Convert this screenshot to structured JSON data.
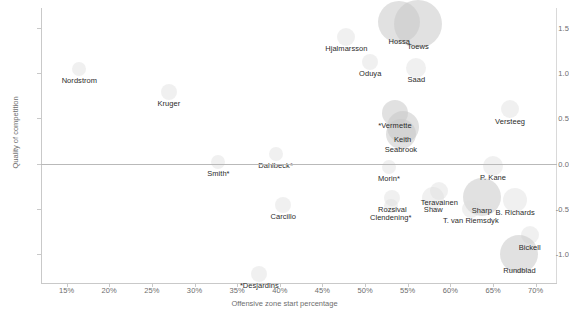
{
  "chart_data": {
    "type": "scatter",
    "title": "",
    "xlabel": "Offensive zone start percentage",
    "ylabel": "Quality of competition",
    "xlim": [
      12.0,
      72.5
    ],
    "ylim": [
      -1.32,
      1.72
    ],
    "xticks": [
      "15%",
      "20%",
      "25%",
      "30%",
      "35%",
      "40%",
      "45%",
      "50%",
      "55%",
      "60%",
      "65%",
      "70%"
    ],
    "xtick_values": [
      15,
      20,
      25,
      30,
      35,
      40,
      45,
      50,
      55,
      60,
      65,
      70
    ],
    "yticks": [
      "1.5",
      "1.0",
      "0.5",
      "0.0",
      "-0.5",
      "-1.0"
    ],
    "ytick_values": [
      1.5,
      1.0,
      0.5,
      0.0,
      -0.5,
      -1.0
    ],
    "grid": false,
    "legend": "none",
    "zero_reference_line": 0.0,
    "bubble_size_note": "marker area encodes ice time",
    "points": [
      {
        "label": "Nordstrom",
        "x": 16.5,
        "y": 1.05,
        "size": 7,
        "label_dx": 0,
        "label_dy": 7,
        "faint": true
      },
      {
        "label": "Kruger",
        "x": 27.0,
        "y": 0.79,
        "size": 8,
        "label_dx": 0,
        "label_dy": 7,
        "faint": true
      },
      {
        "label": "Hjalmarsson",
        "x": 47.8,
        "y": 1.4,
        "size": 9,
        "label_dx": 0,
        "label_dy": 7,
        "faint": true
      },
      {
        "label": "Hossa",
        "x": 54.0,
        "y": 1.56,
        "size": 21,
        "label_dx": 0,
        "label_dy": 15,
        "faint": false
      },
      {
        "label": "Toews",
        "x": 56.2,
        "y": 1.54,
        "size": 24,
        "label_dx": 0,
        "label_dy": 18,
        "faint": false
      },
      {
        "label": "Oduya",
        "x": 50.6,
        "y": 1.12,
        "size": 8,
        "label_dx": 0,
        "label_dy": 7,
        "faint": true
      },
      {
        "label": "Saad",
        "x": 56.0,
        "y": 1.06,
        "size": 10,
        "label_dx": 0,
        "label_dy": 7,
        "faint": true
      },
      {
        "label": "Versteeg",
        "x": 67.0,
        "y": 0.6,
        "size": 9,
        "label_dx": 0,
        "label_dy": 8,
        "faint": true
      },
      {
        "label": "*Vermette",
        "x": 53.5,
        "y": 0.56,
        "size": 13,
        "label_dx": 0,
        "label_dy": 8,
        "faint": false
      },
      {
        "label": "Keith",
        "x": 54.4,
        "y": 0.4,
        "size": 16,
        "label_dx": 0,
        "label_dy": 8,
        "faint": false
      },
      {
        "label": "Seabrook",
        "x": 54.2,
        "y": 0.33,
        "size": 15,
        "label_dx": 0,
        "label_dy": 11,
        "faint": false
      },
      {
        "label": "Dahlbeck*",
        "x": 39.5,
        "y": 0.11,
        "size": 7,
        "label_dx": 0,
        "label_dy": 7,
        "faint": true
      },
      {
        "label": "Smith*",
        "x": 32.8,
        "y": 0.02,
        "size": 7,
        "label_dx": 0,
        "label_dy": 7,
        "faint": true
      },
      {
        "label": "Morin*",
        "x": 52.8,
        "y": -0.04,
        "size": 7,
        "label_dx": 0,
        "label_dy": 7,
        "faint": true
      },
      {
        "label": "P. Kane",
        "x": 65.0,
        "y": -0.03,
        "size": 10,
        "label_dx": 0,
        "label_dy": 7,
        "faint": true
      },
      {
        "label": "Teravainen",
        "x": 58.7,
        "y": -0.3,
        "size": 9,
        "label_dx": 0,
        "label_dy": 7,
        "faint": true
      },
      {
        "label": "Shaw",
        "x": 58.0,
        "y": -0.38,
        "size": 11,
        "label_dx": 0,
        "label_dy": 7,
        "faint": true
      },
      {
        "label": "Sharp",
        "x": 63.7,
        "y": -0.37,
        "size": 19,
        "label_dx": 0,
        "label_dy": 9,
        "faint": false
      },
      {
        "label": "B. Richards",
        "x": 67.6,
        "y": -0.4,
        "size": 12,
        "label_dx": 0,
        "label_dy": 8,
        "faint": true
      },
      {
        "label": "Rozsival",
        "x": 53.2,
        "y": -0.38,
        "size": 8,
        "label_dx": 0,
        "label_dy": 7,
        "faint": true
      },
      {
        "label": "Clendening*",
        "x": 53.0,
        "y": -0.47,
        "size": 7,
        "label_dx": 0,
        "label_dy": 7,
        "faint": true
      },
      {
        "label": "T. van Riemsdyk",
        "x": 62.4,
        "y": -0.5,
        "size": 9,
        "label_dx": 0,
        "label_dy": 7,
        "faint": true
      },
      {
        "label": "Carcillo",
        "x": 40.4,
        "y": -0.46,
        "size": 8,
        "label_dx": 0,
        "label_dy": 7,
        "faint": true
      },
      {
        "label": "Bickell",
        "x": 69.3,
        "y": -0.79,
        "size": 9,
        "label_dx": 0,
        "label_dy": 8,
        "faint": true
      },
      {
        "label": "Rundblad",
        "x": 68.1,
        "y": -1.0,
        "size": 19,
        "label_dx": 0,
        "label_dy": 12,
        "faint": false
      },
      {
        "label": "*Desjardins",
        "x": 37.6,
        "y": -1.22,
        "size": 8,
        "label_dx": 0,
        "label_dy": 7,
        "faint": true
      }
    ]
  }
}
